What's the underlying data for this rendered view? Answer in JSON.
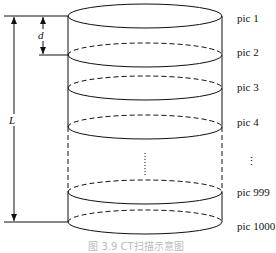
{
  "diagram": {
    "labels": {
      "d": "d",
      "L": "L"
    },
    "slices": [
      {
        "label": "pic 1"
      },
      {
        "label": "pic 2"
      },
      {
        "label": "pic 3"
      },
      {
        "label": "pic 4"
      },
      {
        "label": "⋮"
      },
      {
        "label": "pic 999"
      },
      {
        "label": "pic 1000"
      }
    ],
    "caption": "图 3.9   CT扫描示意图"
  }
}
